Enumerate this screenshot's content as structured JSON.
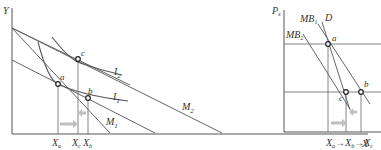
{
  "left_panel": {
    "y_axis_label": "Y",
    "x_axis_label": "X",
    "budget_lines": [
      {
        "label": "M",
        "sub": "1"
      },
      {
        "label": "M",
        "sub": "2"
      }
    ],
    "indifference_curves": [
      {
        "label": "I",
        "sub": "1"
      },
      {
        "label": "I",
        "sub": "2"
      }
    ],
    "points": [
      "a",
      "b",
      "c"
    ],
    "x_ticks": [
      {
        "label": "X",
        "sub": "a"
      },
      {
        "label": "X",
        "sub": "c"
      },
      {
        "label": "X",
        "sub": "b"
      }
    ]
  },
  "right_panel": {
    "y_axis_label": "P",
    "y_axis_sub": "x",
    "curves": [
      {
        "label": "MB",
        "sub": "1"
      },
      {
        "label": "MB",
        "sub": "2"
      },
      {
        "label": "D",
        "sub": ""
      }
    ],
    "points": [
      "a",
      "b",
      "c"
    ],
    "x_label_sequence": [
      {
        "label": "X",
        "sub": "a"
      },
      {
        "label": "X",
        "sub": "b"
      },
      {
        "label": "X",
        "sub": "c"
      }
    ],
    "arrow_symbol": "→"
  },
  "colors": {
    "arrow": "#bfbfbf",
    "line": "#666666"
  }
}
